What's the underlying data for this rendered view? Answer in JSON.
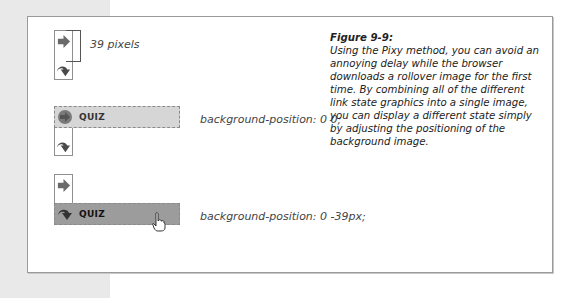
{
  "figure": {
    "title": "Figure 9-9:",
    "caption": "Using the Pixy method, you can avoid an annoying delay while the browser downloads a rollover image for the first time. By combining all of the different link state graphics into a single image, you can display a different state simply by adjusting the positioning of the background image."
  },
  "sprite_diagram": {
    "offset_label": "39 pixels",
    "icons": [
      "arrow-right-icon",
      "arrow-curve-down-icon"
    ]
  },
  "examples": [
    {
      "state": "normal",
      "button_label": "QUIZ",
      "css_note": "background-position: 0 0;"
    },
    {
      "state": "hover",
      "button_label": "QUIZ",
      "css_note": "background-position: 0 -39px;"
    }
  ],
  "colors": {
    "sidebar": "#e9e9e9",
    "frame_border": "#9a9a9a",
    "button_normal": "#d6d6d6",
    "button_hover": "#9c9c9c",
    "icon": "#6a6a6a"
  }
}
